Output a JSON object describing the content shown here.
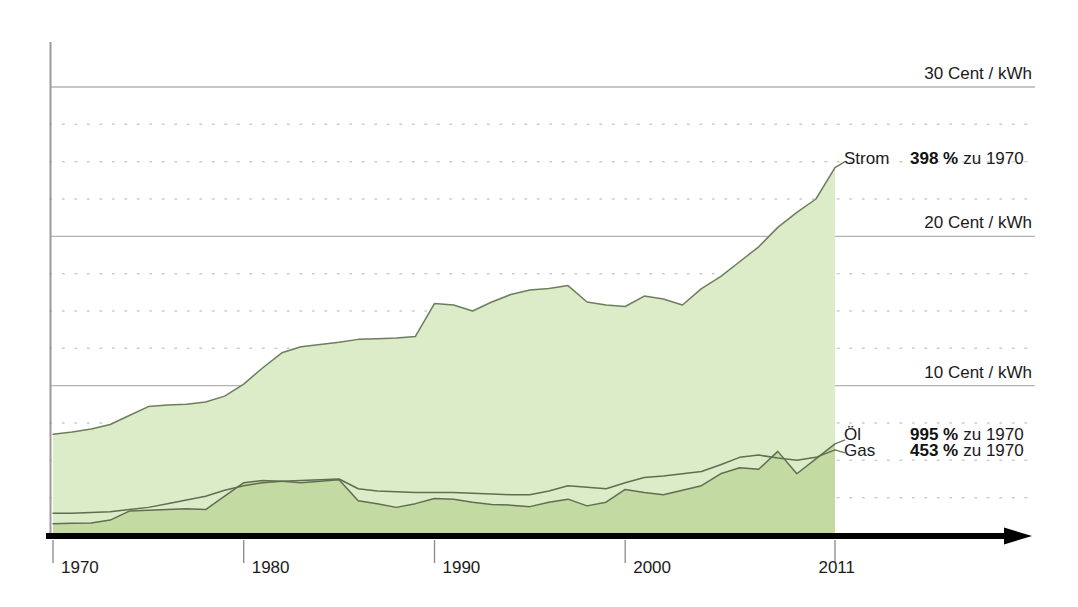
{
  "chart_data": {
    "type": "area",
    "title": "",
    "subtitle": "",
    "xlabel": "",
    "ylabel": "Cent / kWh",
    "xlim": [
      1970,
      2011
    ],
    "ylim": [
      0,
      32.5
    ],
    "grid": true,
    "grid_major_step": 10,
    "grid_minor_step": 2.5,
    "legend_position": "right",
    "x": [
      1970,
      1971,
      1972,
      1973,
      1974,
      1975,
      1976,
      1977,
      1978,
      1979,
      1980,
      1981,
      1982,
      1983,
      1984,
      1985,
      1986,
      1987,
      1988,
      1989,
      1990,
      1991,
      1992,
      1993,
      1994,
      1995,
      1996,
      1997,
      1998,
      1999,
      2000,
      2001,
      2002,
      2003,
      2004,
      2005,
      2006,
      2007,
      2008,
      2009,
      2010,
      2011
    ],
    "xtick_labels": [
      "1970",
      "1980",
      "1990",
      "2000",
      "2011"
    ],
    "xtick_values": [
      1970,
      1980,
      1990,
      2000,
      2011
    ],
    "ytick_labels": [
      "10 Cent / kWh",
      "20 Cent / kWh",
      "30 Cent / kWh"
    ],
    "ytick_values": [
      10,
      20,
      30
    ],
    "series": [
      {
        "name": "Strom",
        "label": "Strom",
        "value_bold": "398",
        "value_unit": "%",
        "value_suffix": "zu 1970",
        "fill_color": "#dcebc8",
        "line_color": "#6e7d5e",
        "values": [
          6.75,
          6.9,
          7.1,
          7.4,
          8.0,
          8.6,
          8.7,
          8.75,
          8.9,
          9.3,
          10.1,
          11.2,
          12.2,
          12.6,
          12.75,
          12.9,
          13.1,
          13.15,
          13.2,
          13.3,
          15.5,
          15.4,
          15.0,
          15.6,
          16.1,
          16.4,
          16.5,
          16.7,
          15.6,
          15.4,
          15.3,
          16.0,
          15.8,
          15.4,
          16.5,
          17.3,
          18.3,
          19.3,
          20.6,
          21.6,
          22.5,
          24.6
        ]
      },
      {
        "name": "Öl",
        "label": "Öl",
        "value_bold": "995",
        "value_unit": "%",
        "value_suffix": "zu 1970",
        "fill_color": "#c3daa2",
        "line_color": "#5f6f50",
        "values": [
          0.75,
          0.78,
          0.8,
          1.0,
          1.6,
          1.65,
          1.7,
          1.75,
          1.7,
          2.6,
          3.5,
          3.65,
          3.6,
          3.5,
          3.6,
          3.7,
          2.3,
          2.1,
          1.85,
          2.1,
          2.45,
          2.4,
          2.2,
          2.05,
          2.0,
          1.9,
          2.2,
          2.4,
          1.95,
          2.2,
          3.05,
          2.85,
          2.7,
          3.0,
          3.3,
          4.1,
          4.5,
          4.4,
          5.6,
          4.1,
          5.1,
          6.1
        ]
      },
      {
        "name": "Gas",
        "label": "Gas",
        "value_bold": "453",
        "value_unit": "%",
        "value_suffix": "zu 1970",
        "fill_color": "none",
        "line_color": "#5f6f50",
        "values": [
          1.45,
          1.45,
          1.5,
          1.55,
          1.7,
          1.85,
          2.1,
          2.35,
          2.6,
          3.0,
          3.3,
          3.5,
          3.6,
          3.65,
          3.7,
          3.75,
          3.1,
          2.95,
          2.9,
          2.85,
          2.85,
          2.85,
          2.8,
          2.75,
          2.7,
          2.7,
          2.95,
          3.3,
          3.2,
          3.1,
          3.5,
          3.85,
          3.95,
          4.1,
          4.25,
          4.7,
          5.2,
          5.35,
          5.15,
          5.0,
          5.2,
          5.7
        ]
      }
    ]
  },
  "axis": {
    "arrow_name": "x-axis-arrow"
  }
}
